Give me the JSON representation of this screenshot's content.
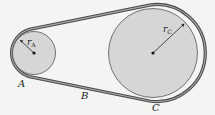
{
  "diagram": {
    "type": "belt-and-pulley",
    "colors": {
      "background": "#f4f4f2",
      "pulley_fill": "#d6d6d6",
      "pulley_stroke": "#555555",
      "belt_outer": "#4a4a4a",
      "belt_inner": "#a8a8a8",
      "text": "#222222"
    },
    "pulleys": [
      {
        "id": "A",
        "label": "A",
        "radius_label": "r",
        "radius_sub": "A",
        "cx": 34,
        "cy": 53,
        "r": 22
      },
      {
        "id": "C",
        "label": "C",
        "radius_label": "r",
        "radius_sub": "C",
        "cx": 153,
        "cy": 53,
        "r": 45
      }
    ],
    "belt_point_label": "B"
  }
}
